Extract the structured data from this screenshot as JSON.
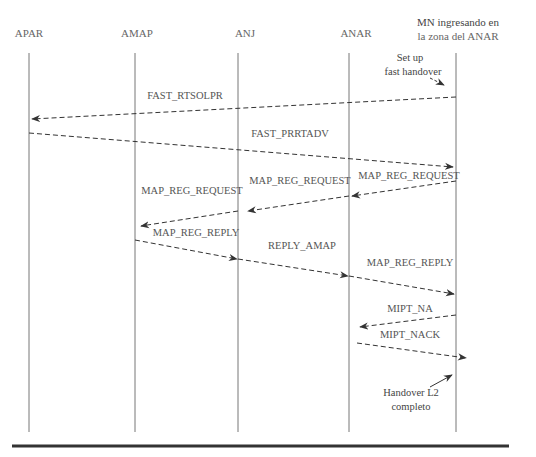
{
  "diagram": {
    "type": "sequence",
    "participants": [
      {
        "id": "apar",
        "label": "APAR",
        "x": 29
      },
      {
        "id": "amap",
        "label": "AMAP",
        "x": 135
      },
      {
        "id": "anj",
        "label": "ANJ",
        "x": 238
      },
      {
        "id": "anar",
        "label": "ANAR",
        "x": 349
      },
      {
        "id": "mn",
        "label_line1": "MN ingresando en",
        "label_line2": "la zona del ANAR",
        "x": 456
      }
    ],
    "messages": [
      {
        "label": "FAST_RTSOLPR",
        "from": "mn",
        "to": "apar"
      },
      {
        "label": "FAST_PRRTADV",
        "from": "apar",
        "to": "mn"
      },
      {
        "label": "MAP_REG_REQUEST",
        "from": "mn",
        "to": "anar"
      },
      {
        "label": "MAP_REG_REQUEST",
        "from": "anar",
        "to": "anj"
      },
      {
        "label": "MAP_REG_REQUEST",
        "from": "anj",
        "to": "amap"
      },
      {
        "label": "MAP_REG_REPLY",
        "from": "amap",
        "to": "anj"
      },
      {
        "label": "REPLY_AMAP",
        "from": "anj",
        "to": "anar"
      },
      {
        "label": "MAP_REG_REPLY",
        "from": "anar",
        "to": "mn"
      },
      {
        "label": "MIPT_NA",
        "from": "mn",
        "to": "anar"
      },
      {
        "label": "MIPT_NACK",
        "from": "anar",
        "to": "mn"
      }
    ],
    "notes": [
      {
        "line1": "Set up",
        "line2": "fast handover"
      },
      {
        "line1": "Handover L2",
        "line2": "completo"
      }
    ],
    "colors": {
      "line": "#777777",
      "arrow": "#333333",
      "rule": "#333333"
    }
  }
}
